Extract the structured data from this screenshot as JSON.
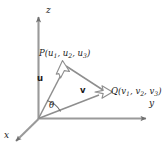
{
  "figure": {
    "type": "vector-angle-3d-diagram",
    "background_color": "#ffffff",
    "line_color": "#8a8a8a",
    "text_color": "#1a1a1a",
    "axes": {
      "z_label": "z",
      "y_label": "y",
      "x_label": "x",
      "origin": "O"
    },
    "points": {
      "p_name": "P",
      "p_coords": "(u1, u2, u3)",
      "p_label_full": "P(u1, u2, u3)",
      "q_name": "Q",
      "q_coords": "(v1, v2, v3)",
      "q_label_full": "Q(v1, v2, v3)"
    },
    "vectors": {
      "u_label": "u",
      "v_label": "v"
    },
    "angle": {
      "symbol": "θ",
      "description": "angle between vectors u and v at the origin"
    }
  }
}
